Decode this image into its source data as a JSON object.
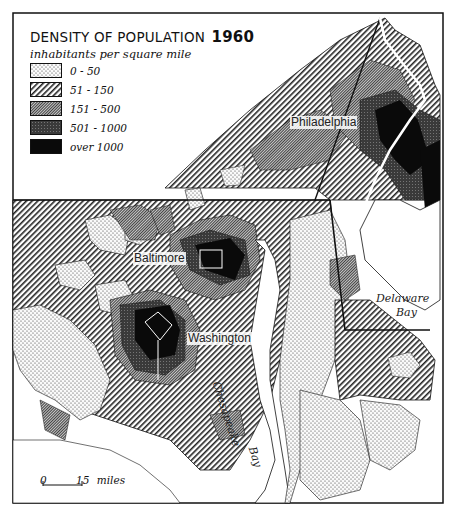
{
  "map": {
    "title": "DENSITY OF POPULATION",
    "year": "1960",
    "subtitle": "inhabitants per square mile",
    "legend": [
      {
        "label": "0 - 50",
        "pattern": "dots",
        "fill": "#f4f4f4"
      },
      {
        "label": "51 - 150",
        "pattern": "diagonal-hatch",
        "fill": "#bdbdbd"
      },
      {
        "label": "151 - 500",
        "pattern": "dense-hatch",
        "fill": "#8f8f8f"
      },
      {
        "label": "501 - 1000",
        "pattern": "crosshatch-dark",
        "fill": "#3c3c3c"
      },
      {
        "label": "over 1000",
        "pattern": "solid",
        "fill": "#0a0a0a"
      }
    ],
    "cities": [
      {
        "name": "Philadelphia"
      },
      {
        "name": "Baltimore"
      },
      {
        "name": "Washington"
      }
    ],
    "water_labels": {
      "delaware_1": "Delaware",
      "delaware_2": "Bay",
      "chesapeake_1": "Chesapeake",
      "chesapeake_2": "Bay"
    },
    "scale": {
      "start": "0",
      "end": "15",
      "unit": "miles"
    }
  }
}
